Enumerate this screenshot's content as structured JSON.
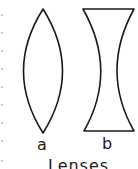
{
  "figure": {
    "title": "Lenses",
    "lenses": [
      {
        "id": "a",
        "label": "a",
        "type": "biconvex"
      },
      {
        "id": "b",
        "label": "b",
        "type": "biconcave"
      }
    ],
    "stroke_color": "#1a1a1a"
  }
}
